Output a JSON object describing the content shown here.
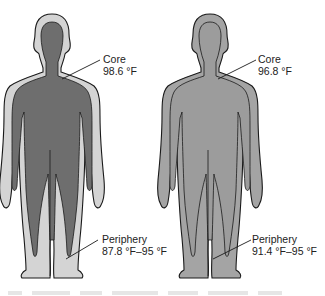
{
  "figure": {
    "left": {
      "core_label": "Core",
      "core_value": "98.6 °F",
      "periphery_label": "Periphery",
      "periphery_value": "87.8 °F–95 °F",
      "colors": {
        "shell": "#d4d4d4",
        "core": "#6e6e6e",
        "outline": "#1a1a1a"
      }
    },
    "right": {
      "core_label": "Core",
      "core_value": "96.8 °F",
      "periphery_label": "Periphery",
      "periphery_value": "91.4 °F–95 °F",
      "colors": {
        "shell": "#a4a4a4",
        "core": "#9c9c9c",
        "outline": "#1a1a1a"
      }
    }
  }
}
